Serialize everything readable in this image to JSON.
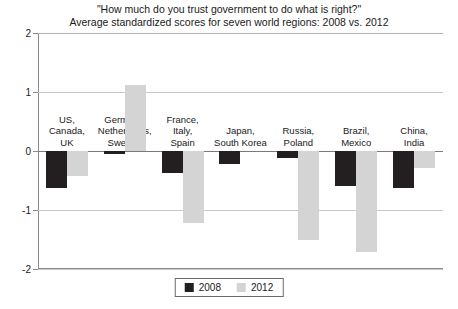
{
  "chart_data": {
    "type": "bar",
    "title": "\"How much do you trust government to do what is right?\"",
    "subtitle": "Average standardized scores for seven world regions: 2008 vs. 2012",
    "xlabel": "",
    "ylabel": "",
    "ylim": [
      -2,
      2
    ],
    "yticks": [
      "2",
      "1",
      "0",
      "-1",
      "-2"
    ],
    "ytick_values": [
      2,
      1,
      0,
      -1,
      -2
    ],
    "grid": true,
    "legend_position": "bottom-center",
    "categories": [
      "US,\nCanada,\nUK",
      "Germany,\nNetherlands,\nSweden",
      "France,\nItaly,\nSpain",
      "Japan,\nSouth Korea",
      "Russia,\nPoland",
      "Brazil,\nMexico",
      "China,\nIndia"
    ],
    "category_lines": [
      [
        "US,",
        "Canada,",
        "UK"
      ],
      [
        "Germany,",
        "Netherlands,",
        "Sweden"
      ],
      [
        "France,",
        "Italy,",
        "Spain"
      ],
      [
        "Japan,",
        "South Korea"
      ],
      [
        "Russia,",
        "Poland"
      ],
      [
        "Brazil,",
        "Mexico"
      ],
      [
        "China,",
        "India"
      ]
    ],
    "series": [
      {
        "name": "2008",
        "color": "#231f20",
        "values": [
          -0.62,
          -0.05,
          -0.38,
          -0.22,
          -0.12,
          -0.6,
          -0.62
        ]
      },
      {
        "name": "2012",
        "color": "#d4d4d4",
        "values": [
          -0.42,
          1.12,
          -1.22,
          0.0,
          -1.5,
          -1.72,
          -0.28
        ]
      }
    ]
  },
  "legend": {
    "items": [
      {
        "label": "2008",
        "color": "#231f20"
      },
      {
        "label": "2012",
        "color": "#d4d4d4"
      }
    ]
  }
}
